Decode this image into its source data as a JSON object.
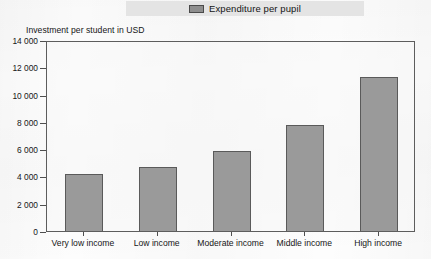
{
  "legend": {
    "label": "Expenditure per pupil",
    "swatch_color": "#8e8e8e"
  },
  "axis_title": "Investment per student in USD",
  "chart_data": {
    "type": "bar",
    "title": "",
    "subtitle": "",
    "xlabel": "",
    "ylabel": "Investment per student in USD",
    "categories": [
      "Very low income",
      "Low income",
      "Moderate income",
      "Middle income",
      "High income"
    ],
    "series": [
      {
        "name": "Expenditure per pupil",
        "values": [
          4180,
          4690,
          5860,
          7770,
          11290
        ],
        "color": "#9a9a9a"
      }
    ],
    "values": [
      4180,
      4690,
      5860,
      7770,
      11290
    ],
    "ylim": [
      0,
      14000
    ],
    "ytick_values": [
      0,
      2000,
      4000,
      6000,
      8000,
      10000,
      12000,
      14000
    ],
    "ytick_labels": [
      "0",
      "2 000",
      "4 000",
      "6 000",
      "8 000",
      "10 000",
      "12 000",
      "14 000"
    ],
    "grid": false,
    "legend_position": "top-center"
  }
}
